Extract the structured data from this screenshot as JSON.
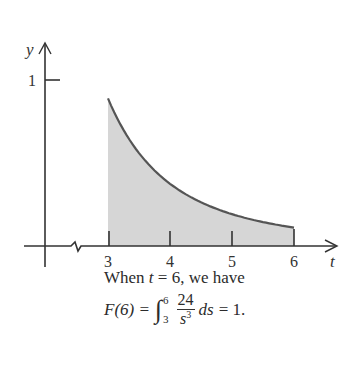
{
  "chart_data": {
    "type": "area",
    "title": "",
    "function": "f(s) = 24 / s^3",
    "xlabel": "t",
    "ylabel": "y",
    "x_ticks": [
      3,
      4,
      5,
      6
    ],
    "y_ticks": [
      1
    ],
    "x_range": [
      3,
      6
    ],
    "shaded_region": {
      "from": 3,
      "to": 6
    },
    "axis_break": true,
    "x": [
      3,
      3.5,
      4,
      4.5,
      5,
      5.5,
      6
    ],
    "values": [
      0.889,
      0.56,
      0.375,
      0.263,
      0.192,
      0.144,
      0.111
    ],
    "grid": false,
    "colors": {
      "curve": "#555555",
      "fill": "#d6d6d6",
      "axis": "#333333"
    }
  },
  "axes": {
    "y_label": "y",
    "x_label": "t",
    "y_tick_1": "1",
    "x_tick_3": "3",
    "x_tick_4": "4",
    "x_tick_5": "5",
    "x_tick_6": "6"
  },
  "caption": {
    "line1_prefix": "When ",
    "line1_var": "t",
    "line1_suffix": " = 6, we have",
    "lhs": "F(6) =",
    "integral_symbol": "∫",
    "upper_limit": "6",
    "lower_limit": "3",
    "numerator": "24",
    "denominator_base": "s",
    "denominator_exp": "3",
    "differential": "ds",
    "result": "= 1."
  }
}
